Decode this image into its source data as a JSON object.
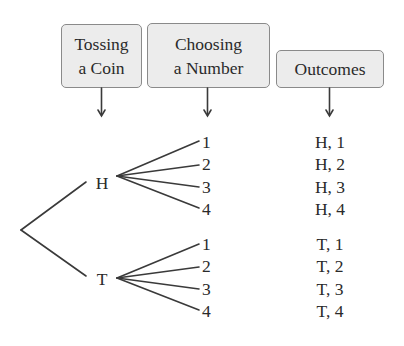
{
  "headers": [
    {
      "lines": [
        "Tossing",
        "a Coin"
      ]
    },
    {
      "lines": [
        "Choosing",
        "a Number"
      ]
    },
    {
      "lines": [
        "Outcomes"
      ]
    }
  ],
  "tree": {
    "first_stage": [
      "H",
      "T"
    ],
    "second_stage": [
      "1",
      "2",
      "3",
      "4"
    ]
  },
  "outcomes": [
    "H, 1",
    "H, 2",
    "H, 3",
    "H, 4",
    "T, 1",
    "T, 2",
    "T, 3",
    "T, 4"
  ],
  "colors": {
    "box_fill": "#ececec",
    "box_border": "#8a8a8a",
    "line": "#3a3a3a",
    "text": "#2a2a2a"
  }
}
